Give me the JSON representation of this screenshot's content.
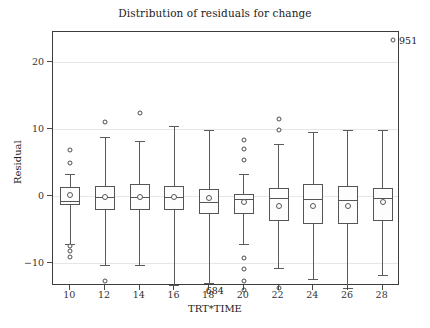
{
  "chart_data": {
    "type": "box",
    "title": "Distribution of residuals for change",
    "xlabel": "TRT*TIME",
    "ylabel": "Residual",
    "xlim": [
      9,
      29
    ],
    "ylim": [
      -13.5,
      24.5
    ],
    "yticks": [
      20,
      10,
      0,
      -10
    ],
    "ytick_labels": [
      "20",
      "10",
      "0",
      "−10"
    ],
    "xticks": [
      10,
      12,
      14,
      16,
      18,
      20,
      22,
      24,
      26,
      28
    ],
    "xtick_labels": [
      "10",
      "12",
      "14",
      "16",
      "18",
      "20",
      "22",
      "24",
      "26",
      "28"
    ],
    "grid": "horizontal",
    "legend": "none",
    "categories": [
      "10",
      "12",
      "14",
      "16",
      "18",
      "20",
      "22",
      "24",
      "26",
      "28"
    ],
    "boxes": [
      {
        "category": "10",
        "whisker_low": -7.2,
        "q1": -1.4,
        "median": -0.8,
        "q3": 1.3,
        "whisker_high": 3.3,
        "mean": 0.1,
        "outliers": [
          6.9,
          4.9,
          -7.5,
          -8.2,
          -9.2
        ]
      },
      {
        "category": "12",
        "whisker_low": -10.4,
        "q1": -2.2,
        "median": -0.2,
        "q3": 1.4,
        "whisker_high": 8.8,
        "mean": -0.2,
        "outliers": [
          11.1,
          -12.7
        ]
      },
      {
        "category": "14",
        "whisker_low": -10.4,
        "q1": -2.2,
        "median": -0.2,
        "q3": 1.7,
        "whisker_high": 8.2,
        "mean": -0.2,
        "outliers": [
          12.4
        ]
      },
      {
        "category": "16",
        "whisker_low": -13.4,
        "q1": -2.2,
        "median": -0.2,
        "q3": 1.5,
        "whisker_high": 10.4,
        "mean": -0.2,
        "outliers": []
      },
      {
        "category": "18",
        "whisker_low": -13.0,
        "q1": -2.7,
        "median": -0.9,
        "q3": 1.0,
        "whisker_high": 9.9,
        "mean": -0.4,
        "outliers": []
      },
      {
        "category": "20",
        "whisker_low": -7.2,
        "q1": -2.7,
        "median": -0.5,
        "q3": 0.3,
        "whisker_high": 3.2,
        "mean": -1.0,
        "outliers": [
          8.4,
          7.0,
          5.4,
          -9.3,
          -11.0,
          -12.7
        ],
        "labeled_outliers": [
          {
            "label": "684",
            "value": -14.1
          }
        ]
      },
      {
        "category": "22",
        "whisker_low": -10.8,
        "q1": -3.8,
        "median": -0.4,
        "q3": 1.2,
        "whisker_high": 7.8,
        "mean": -1.5,
        "outliers": [
          11.5,
          9.9,
          -13.8
        ]
      },
      {
        "category": "24",
        "whisker_low": -12.5,
        "q1": -4.3,
        "median": -0.5,
        "q3": 1.7,
        "whisker_high": 9.5,
        "mean": -1.5,
        "outliers": []
      },
      {
        "category": "26",
        "whisker_low": -13.8,
        "q1": -4.2,
        "median": -0.6,
        "q3": 1.5,
        "whisker_high": 9.8,
        "mean": -1.5,
        "outliers": []
      },
      {
        "category": "28",
        "whisker_low": -11.8,
        "q1": -3.8,
        "median": -0.4,
        "q3": 1.2,
        "whisker_high": 9.8,
        "mean": -1.0,
        "outliers": []
      }
    ],
    "annotations": [
      {
        "label": "951",
        "x": 28.6,
        "y": 23.3,
        "marker": "circle"
      }
    ]
  },
  "colors": {
    "frame": "#3c3c3c",
    "grid": "#e6e6e6",
    "box_stroke": "#555555",
    "marker_stroke": "#4d4d4d",
    "text": "#222222",
    "background": "#ffffff"
  }
}
